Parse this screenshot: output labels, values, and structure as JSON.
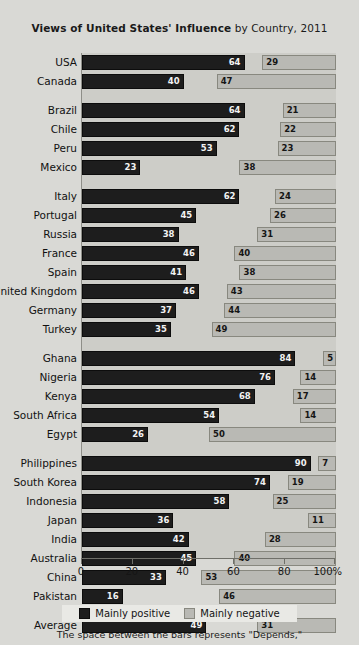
{
  "title": {
    "bold": "Views of United States' Influence",
    "regular": " by Country, 2011"
  },
  "footnote": "The space between the bars represents \"Depends,\"",
  "legend": {
    "position_label": "Mainly positive",
    "negative_label": "Mainly negative"
  },
  "axis": {
    "ticks": [
      "0",
      "20",
      "40",
      "60",
      "80",
      "100%"
    ],
    "values": [
      0,
      20,
      40,
      60,
      80,
      100
    ]
  },
  "colors": {
    "positive": "#1d1d1d",
    "negative": "#b9b9b4",
    "plot_background": "#cdcdc8",
    "page_background": "#d9d9d5"
  },
  "chart_data": {
    "type": "bar",
    "title": "Views of United States' Influence by Country, 2011",
    "xlabel": "",
    "ylabel": "",
    "xlim": [
      0,
      100
    ],
    "grid": false,
    "legend_position": "bottom",
    "orientation": "horizontal",
    "note": "Dark bars start at 0%; light bars are right-aligned ending at 100%. The gap between them represents \"Depends\".",
    "series": [
      {
        "name": "Mainly positive",
        "color": "#1d1d1d"
      },
      {
        "name": "Mainly negative",
        "color": "#b9b9b4"
      }
    ],
    "groups": [
      {
        "name": "North America",
        "rows": [
          {
            "country": "USA",
            "positive": 64,
            "negative": 29
          },
          {
            "country": "Canada",
            "positive": 40,
            "negative": 47
          }
        ]
      },
      {
        "name": "Latin America",
        "rows": [
          {
            "country": "Brazil",
            "positive": 64,
            "negative": 21
          },
          {
            "country": "Chile",
            "positive": 62,
            "negative": 22
          },
          {
            "country": "Peru",
            "positive": 53,
            "negative": 23
          },
          {
            "country": "Mexico",
            "positive": 23,
            "negative": 38
          }
        ]
      },
      {
        "name": "Europe",
        "rows": [
          {
            "country": "Italy",
            "positive": 62,
            "negative": 24
          },
          {
            "country": "Portugal",
            "positive": 45,
            "negative": 26
          },
          {
            "country": "Russia",
            "positive": 38,
            "negative": 31
          },
          {
            "country": "France",
            "positive": 46,
            "negative": 40
          },
          {
            "country": "Spain",
            "positive": 41,
            "negative": 38
          },
          {
            "country": "United Kingdom",
            "positive": 46,
            "negative": 43
          },
          {
            "country": "Germany",
            "positive": 37,
            "negative": 44
          },
          {
            "country": "Turkey",
            "positive": 35,
            "negative": 49
          }
        ]
      },
      {
        "name": "Africa",
        "rows": [
          {
            "country": "Ghana",
            "positive": 84,
            "negative": 5
          },
          {
            "country": "Nigeria",
            "positive": 76,
            "negative": 14
          },
          {
            "country": "Kenya",
            "positive": 68,
            "negative": 17
          },
          {
            "country": "South Africa",
            "positive": 54,
            "negative": 14
          },
          {
            "country": "Egypt",
            "positive": 26,
            "negative": 50
          }
        ]
      },
      {
        "name": "Asia Pacific",
        "rows": [
          {
            "country": "Philippines",
            "positive": 90,
            "negative": 7
          },
          {
            "country": "South Korea",
            "positive": 74,
            "negative": 19
          },
          {
            "country": "Indonesia",
            "positive": 58,
            "negative": 25
          },
          {
            "country": "Japan",
            "positive": 36,
            "negative": 11
          },
          {
            "country": "India",
            "positive": 42,
            "negative": 28
          },
          {
            "country": "Australia",
            "positive": 45,
            "negative": 40
          },
          {
            "country": "China",
            "positive": 33,
            "negative": 53
          },
          {
            "country": "Pakistan",
            "positive": 16,
            "negative": 46
          }
        ]
      },
      {
        "name": "Average",
        "rows": [
          {
            "country": "Average",
            "positive": 49,
            "negative": 31
          }
        ]
      }
    ]
  }
}
